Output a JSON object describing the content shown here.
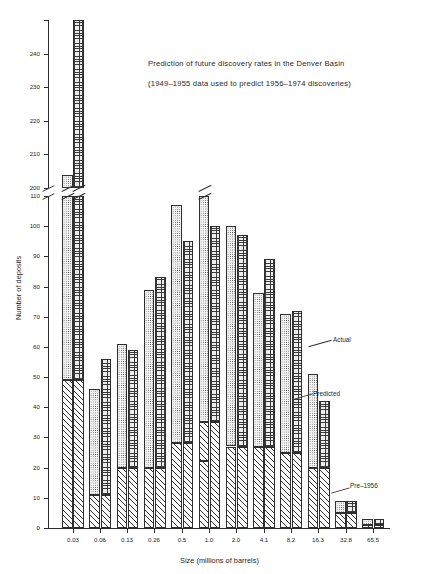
{
  "title": {
    "line1": "Prediction of future discovery rates in the Denver Basin",
    "line2": "(1949–1955 data used to predict 1956–1974 discoveries)"
  },
  "annotations": {
    "actual": "Actual",
    "predicted": "Predicted",
    "pre1956": "Pre–1956"
  },
  "chart_data": {
    "type": "bar",
    "title": "Prediction of future discovery rates in the Denver Basin",
    "subtitle": "(1949–1955 data used to predict 1956–1974 discoveries)",
    "xlabel": "Size (millions of barrels)",
    "ylabel": "Number of deposits",
    "categories": [
      "0.03",
      "0.06",
      "0.13",
      "0.26",
      "0.5",
      "1.0",
      "2.0",
      "4.1",
      "8.2",
      "16.3",
      "32.8",
      "65.5"
    ],
    "ylim": [
      0,
      250
    ],
    "y_ticks_lower": [
      0,
      10,
      20,
      30,
      40,
      50,
      60,
      70,
      80,
      90,
      100,
      110
    ],
    "y_ticks_upper": [
      200,
      210,
      220,
      230,
      240,
      250
    ],
    "axis_break": {
      "below": 110,
      "above": 200
    },
    "grid": false,
    "legend_position": "inline-annotations",
    "stacking": "Predicted and Actual bars are drawn stacked above the shared Pre–1956 base",
    "series": [
      {
        "name": "Pre–1956",
        "values": [
          49,
          11,
          20,
          20,
          28,
          35,
          27,
          27,
          25,
          20,
          5,
          1
        ]
      },
      {
        "name": "Predicted",
        "values": [
          204,
          46,
          61,
          79,
          107,
          119,
          100,
          78,
          71,
          51,
          9,
          3
        ]
      },
      {
        "name": "Actual",
        "values": [
          250,
          56,
          59,
          83,
          95,
          100,
          97,
          89,
          72,
          42,
          9,
          3
        ]
      }
    ]
  }
}
